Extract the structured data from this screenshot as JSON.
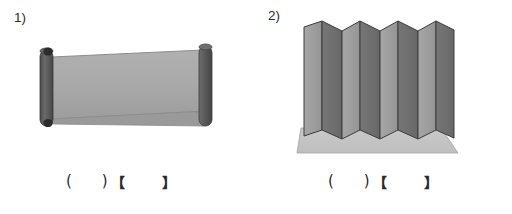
{
  "page": {
    "background_color": "#ffffff",
    "width": 512,
    "height": 214
  },
  "figures": [
    {
      "number_label": "1)",
      "name": "rolled-scroll-banner",
      "description": "A scroll or window-blind shaped object: a flat mid-gray sheet stretched between two dark cylindrical rollers, one at each end, with small dark knobs on the left roller ends.",
      "colors": {
        "sheet": "#a8a8a8",
        "sheet_shadow": "#9b9b9b",
        "roller": "#585858",
        "roller_highlight": "#6e6e6e",
        "roller_dark": "#3d3d3d",
        "knob": "#2e2e2e",
        "outline": "#7a7a7a"
      },
      "answer_blanks": {
        "paren_open": "(",
        "paren_close": ")",
        "bracket_open": "【",
        "bracket_close": "】"
      }
    },
    {
      "number_label": "2)",
      "name": "accordion-pleated-screen",
      "description": "An accordion folded / pleated screen standing upright on a flat light-gray base slab, formed of alternating light and dark vertical panels meeting at sharp zigzag ridges and valleys.",
      "fold_count": 7,
      "colors": {
        "panel_light": "#9d9d9d",
        "panel_dark": "#6f6f6f",
        "panel_outline": "#3a3a3a",
        "base_slab": "#c4c4c4",
        "base_slab_edge": "#ababab",
        "base_outline": "#9a9a9a"
      },
      "answer_blanks": {
        "paren_open": "(",
        "paren_close": ")",
        "bracket_open": "【",
        "bracket_close": "】"
      }
    }
  ]
}
